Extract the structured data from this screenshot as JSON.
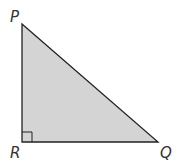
{
  "diagram": {
    "type": "right-triangle",
    "fill_color": "#d4d4d4",
    "stroke_color": "#222222",
    "vertices": [
      {
        "label": "P",
        "x": 22,
        "y": 24,
        "label_x": 10,
        "label_y": 22
      },
      {
        "label": "Q",
        "x": 158,
        "y": 142,
        "label_x": 160,
        "label_y": 158
      },
      {
        "label": "R",
        "x": 22,
        "y": 142,
        "label_x": 10,
        "label_y": 158
      }
    ],
    "right_angle_at": "R",
    "right_angle_marker_size": 10
  }
}
